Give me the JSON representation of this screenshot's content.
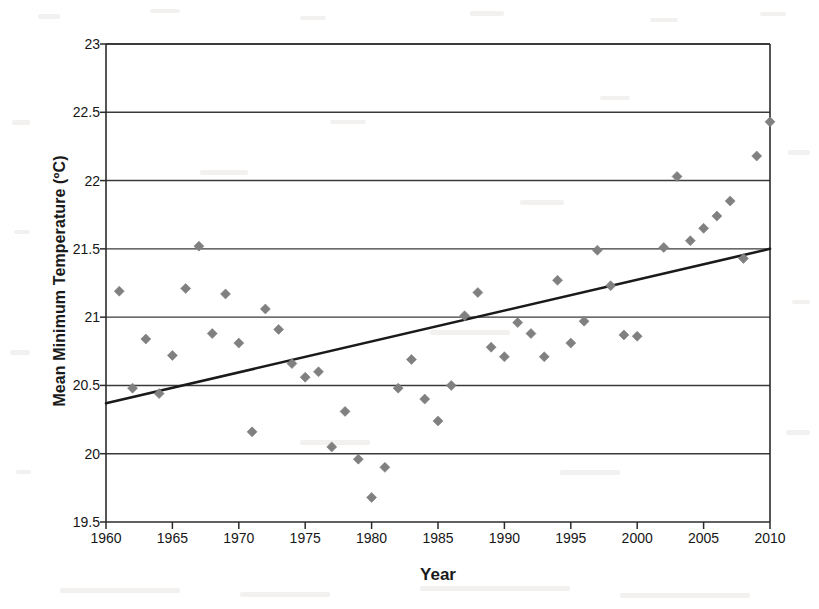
{
  "chart_data": {
    "type": "scatter",
    "title": "",
    "xlabel": "Year",
    "ylabel": "Mean Minimum Temperature (ºC)",
    "xlim": [
      1960,
      2010
    ],
    "ylim": [
      19.5,
      23
    ],
    "xticks": [
      1960,
      1965,
      1970,
      1975,
      1980,
      1985,
      1990,
      1995,
      2000,
      2005,
      2010
    ],
    "yticks": [
      19.5,
      20,
      20.5,
      21,
      21.5,
      22,
      22.5,
      23
    ],
    "xtick_labels": [
      "1960",
      "1965",
      "1970",
      "1975",
      "1980",
      "1985",
      "1990",
      "1995",
      "2000",
      "2005",
      "2010"
    ],
    "ytick_labels": [
      "19.5",
      "20",
      "20.5",
      "21",
      "21.5",
      "22",
      "22.5",
      "23"
    ],
    "grid": "horizontal",
    "legend": "none",
    "marker": "diamond",
    "marker_color": "#808080",
    "series": [
      {
        "name": "Mean Minimum Temperature",
        "type": "scatter",
        "points": [
          [
            1961,
            21.19
          ],
          [
            1962,
            20.48
          ],
          [
            1963,
            20.84
          ],
          [
            1964,
            20.44
          ],
          [
            1965,
            20.72
          ],
          [
            1966,
            21.21
          ],
          [
            1967,
            21.52
          ],
          [
            1968,
            20.88
          ],
          [
            1969,
            21.17
          ],
          [
            1970,
            20.81
          ],
          [
            1971,
            20.16
          ],
          [
            1972,
            21.06
          ],
          [
            1973,
            20.91
          ],
          [
            1974,
            20.66
          ],
          [
            1975,
            20.56
          ],
          [
            1976,
            20.6
          ],
          [
            1977,
            20.05
          ],
          [
            1978,
            20.31
          ],
          [
            1979,
            19.96
          ],
          [
            1980,
            19.68
          ],
          [
            1981,
            19.9
          ],
          [
            1982,
            20.48
          ],
          [
            1983,
            20.69
          ],
          [
            1984,
            20.4
          ],
          [
            1985,
            20.24
          ],
          [
            1986,
            20.5
          ],
          [
            1987,
            21.01
          ],
          [
            1988,
            21.18
          ],
          [
            1989,
            20.78
          ],
          [
            1990,
            20.71
          ],
          [
            1991,
            20.96
          ],
          [
            1992,
            20.88
          ],
          [
            1993,
            20.71
          ],
          [
            1994,
            21.27
          ],
          [
            1995,
            20.81
          ],
          [
            1996,
            20.97
          ],
          [
            1997,
            21.49
          ],
          [
            1998,
            21.23
          ],
          [
            1999,
            20.87
          ],
          [
            2000,
            20.86
          ],
          [
            2002,
            21.51
          ],
          [
            2003,
            22.03
          ],
          [
            2004,
            21.56
          ],
          [
            2005,
            21.65
          ],
          [
            2006,
            21.74
          ],
          [
            2007,
            21.85
          ],
          [
            2008,
            21.43
          ],
          [
            2009,
            22.18
          ],
          [
            2010,
            22.43
          ]
        ]
      },
      {
        "name": "Linear trend",
        "type": "line",
        "color": "#1a1a1a",
        "endpoints": [
          [
            1960,
            20.37
          ],
          [
            2010,
            21.5
          ]
        ]
      }
    ]
  }
}
